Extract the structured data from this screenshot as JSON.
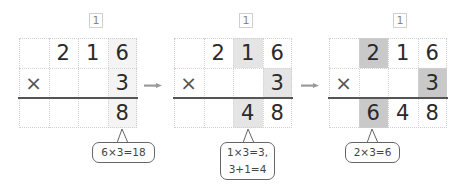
{
  "colors": {
    "grid1_highlight": "#f4f4f4",
    "grid2_highlight": "#e5e5e5",
    "grid3_highlight": "#c9c9c9",
    "arrow": "#9a9a9a"
  },
  "steps": [
    {
      "carry": "1",
      "rows": [
        [
          "",
          "2",
          "1",
          "6"
        ],
        [
          "×",
          "",
          "",
          "3"
        ],
        [
          "",
          "",
          "",
          "8"
        ]
      ],
      "note": [
        "6×3=18"
      ]
    },
    {
      "carry": "1",
      "rows": [
        [
          "",
          "2",
          "1",
          "6"
        ],
        [
          "×",
          "",
          "",
          "3"
        ],
        [
          "",
          "",
          "4",
          "8"
        ]
      ],
      "note": [
        "1×3=3,",
        "3+1=4"
      ]
    },
    {
      "carry": "1",
      "rows": [
        [
          "",
          "2",
          "1",
          "6"
        ],
        [
          "×",
          "",
          "",
          "3"
        ],
        [
          "",
          "6",
          "4",
          "8"
        ]
      ],
      "note": [
        "2×3=6"
      ]
    }
  ],
  "arrow_icon": "right-arrow-icon"
}
